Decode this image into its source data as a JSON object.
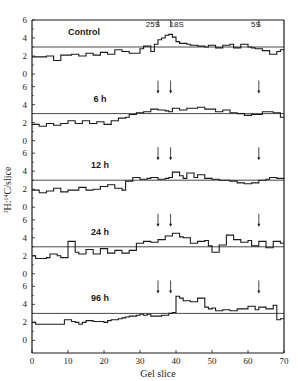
{
  "chart_data": {
    "type": "line",
    "subtype": "step-histogram, stacked panels",
    "title": "",
    "xlabel": "Gel slice",
    "ylabel": "3H:14C/slice",
    "xlim": [
      0,
      70
    ],
    "xticks": [
      0,
      10,
      20,
      30,
      40,
      50,
      60,
      70
    ],
    "ylim": [
      0,
      6
    ],
    "yticks_per_panel": [
      0,
      2,
      4,
      6
    ],
    "grid": false,
    "legend": null,
    "reference_line_value": 3,
    "markers": [
      {
        "label": "25S",
        "x": 35
      },
      {
        "label": "18S",
        "x": 38.5
      },
      {
        "label": "5S",
        "x": 63
      }
    ],
    "panels": [
      {
        "name": "Control",
        "reference": 3,
        "step_width": 1,
        "x_start": 0,
        "values": [
          1.9,
          1.9,
          1.9,
          1.9,
          2.0,
          2.0,
          1.5,
          1.5,
          2.1,
          2.1,
          2.1,
          2.2,
          2.2,
          2.0,
          2.0,
          2.3,
          2.3,
          2.1,
          2.1,
          2.4,
          2.4,
          2.2,
          2.2,
          2.7,
          2.7,
          2.5,
          2.5,
          2.3,
          2.3,
          2.3,
          2.8,
          3.1,
          3.1,
          2.5,
          3.3,
          3.8,
          4.0,
          4.3,
          4.4,
          4.1,
          3.6,
          3.4,
          3.4,
          3.3,
          3.2,
          3.2,
          3.1,
          3.1,
          3.0,
          3.2,
          3.2,
          2.9,
          2.9,
          3.2,
          3.2,
          3.3,
          2.9,
          2.9,
          3.3,
          3.3,
          3.0,
          2.9,
          2.8,
          2.8,
          2.6,
          2.6,
          2.2,
          2.2,
          2.5,
          2.7
        ]
      },
      {
        "name": "6 h",
        "reference": 3,
        "step_width": 1,
        "x_start": 0,
        "values": [
          1.8,
          1.8,
          1.6,
          1.6,
          1.9,
          1.9,
          1.7,
          1.7,
          1.9,
          1.9,
          2.2,
          2.2,
          1.9,
          1.9,
          2.2,
          2.2,
          1.9,
          1.9,
          2.1,
          2.1,
          1.8,
          1.8,
          2.2,
          2.2,
          2.5,
          2.5,
          2.6,
          2.9,
          2.9,
          3.1,
          3.1,
          3.2,
          3.2,
          3.5,
          3.5,
          3.4,
          3.4,
          3.3,
          3.2,
          3.6,
          3.6,
          3.4,
          3.4,
          3.6,
          3.6,
          3.6,
          3.7,
          3.7,
          3.5,
          3.5,
          3.5,
          3.2,
          3.2,
          3.4,
          3.4,
          3.1,
          3.1,
          3.0,
          3.0,
          2.8,
          2.8,
          2.9,
          2.9,
          2.9,
          3.2,
          3.2,
          3.2,
          3.1,
          3.1,
          2.6
        ]
      },
      {
        "name": "12 h",
        "reference": 3,
        "step_width": 1,
        "x_start": 0,
        "values": [
          1.9,
          1.9,
          1.6,
          1.6,
          1.8,
          1.8,
          2.1,
          2.1,
          1.7,
          1.7,
          1.9,
          1.9,
          1.9,
          2.2,
          2.2,
          1.9,
          1.9,
          2.0,
          2.0,
          2.3,
          2.3,
          2.5,
          2.5,
          2.1,
          2.1,
          1.9,
          2.9,
          2.9,
          3.3,
          3.3,
          3.1,
          3.1,
          3.2,
          3.3,
          3.3,
          3.1,
          3.1,
          3.2,
          3.3,
          3.9,
          3.9,
          3.5,
          3.2,
          3.8,
          3.8,
          3.3,
          3.6,
          3.6,
          3.2,
          3.2,
          3.1,
          3.1,
          3.0,
          3.0,
          3.0,
          2.9,
          2.9,
          2.7,
          2.7,
          2.6,
          2.6,
          2.7,
          2.7,
          3.0,
          3.0,
          3.1,
          3.3,
          3.3,
          3.2,
          3.2
        ]
      },
      {
        "name": "24 h",
        "reference": 3,
        "step_width": 1,
        "x_start": 0,
        "values": [
          2.0,
          1.7,
          1.7,
          1.7,
          1.8,
          2.2,
          2.2,
          2.0,
          1.8,
          1.8,
          3.6,
          3.6,
          2.4,
          2.2,
          2.2,
          2.7,
          2.7,
          2.2,
          2.2,
          2.8,
          2.8,
          2.3,
          2.3,
          2.6,
          2.6,
          2.3,
          2.3,
          2.6,
          2.6,
          3.4,
          3.4,
          3.6,
          3.6,
          3.5,
          3.5,
          3.8,
          3.8,
          4.2,
          4.2,
          4.5,
          4.5,
          4.1,
          4.0,
          4.0,
          3.4,
          3.4,
          3.6,
          3.6,
          3.7,
          3.1,
          2.4,
          2.4,
          3.2,
          3.2,
          4.3,
          4.3,
          3.8,
          3.8,
          3.5,
          3.5,
          3.7,
          3.1,
          3.1,
          3.6,
          3.6,
          2.9,
          2.9,
          3.6,
          3.6,
          3.4
        ]
      },
      {
        "name": "96 h",
        "reference": 3,
        "step_width": 1,
        "x_start": 0,
        "values": [
          2.0,
          1.8,
          1.8,
          1.8,
          1.8,
          1.8,
          1.8,
          1.8,
          1.8,
          2.3,
          2.3,
          2.1,
          2.0,
          1.8,
          2.0,
          2.2,
          2.2,
          2.1,
          2.1,
          2.1,
          2.0,
          2.2,
          2.3,
          2.3,
          2.4,
          2.5,
          2.6,
          2.7,
          2.7,
          2.8,
          2.9,
          2.8,
          2.9,
          2.7,
          2.7,
          2.7,
          2.8,
          2.8,
          3.0,
          3.1,
          4.9,
          4.7,
          4.4,
          4.4,
          4.3,
          4.3,
          4.7,
          4.7,
          3.7,
          3.5,
          3.6,
          3.3,
          3.3,
          3.4,
          3.4,
          3.3,
          3.3,
          3.5,
          3.5,
          3.5,
          3.8,
          3.8,
          3.4,
          3.7,
          3.7,
          3.5,
          3.5,
          3.9,
          2.3,
          2.4
        ]
      }
    ]
  },
  "layout": {
    "panel_labels": [
      "Control",
      "6 h",
      "12 h",
      "24 h",
      "96 h"
    ],
    "x_tick_labels": [
      "0",
      "10",
      "20",
      "30",
      "40",
      "50",
      "60",
      "70"
    ],
    "y_tick_labels": [
      "0",
      "2",
      "4",
      "6"
    ],
    "marker_labels": [
      "25S",
      "18S",
      "5S"
    ],
    "xlabel": "Gel slice",
    "ylabel_parts": {
      "h_mass": "3",
      "h": "H:",
      "c_mass": "14",
      "c": "C/slice"
    }
  }
}
